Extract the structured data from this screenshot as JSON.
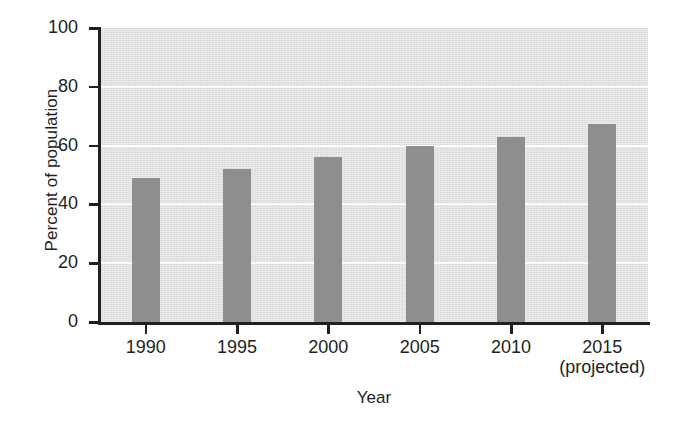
{
  "chart_data": {
    "type": "bar",
    "title": "",
    "subtitle": "",
    "xlabel": "Year",
    "ylabel": "Percent of population",
    "categories": [
      "1990",
      "1995",
      "2000",
      "2005",
      "2010",
      "2015"
    ],
    "category_sublabels": [
      "",
      "",
      "",
      "",
      "",
      "(projected)"
    ],
    "values": [
      49,
      52,
      56,
      60,
      63,
      67.5
    ],
    "ylim": [
      0,
      100
    ],
    "yticks": [
      0,
      20,
      40,
      60,
      80,
      100
    ],
    "ytick_labels": [
      "0",
      "20",
      "40",
      "60",
      "80",
      "100"
    ],
    "grid": "horizontal-gridlines-white-on-gray",
    "legend": "none",
    "colors": {
      "bar": "#8e8e8e",
      "plot_background": "#e0e0e0",
      "gridline": "#fbfbfb",
      "axis": "#231f20",
      "text": "#231f20",
      "page_background": "#ffffff"
    }
  }
}
